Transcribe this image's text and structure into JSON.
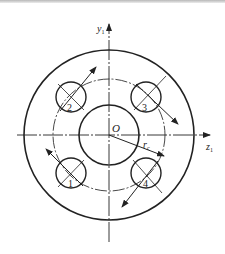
{
  "diagram": {
    "title": "",
    "axes": {
      "vertical_label": "y",
      "vertical_subscript": "1",
      "horizontal_label": "z",
      "horizontal_subscript": "1"
    },
    "origin_label": "O",
    "radius_label": "r",
    "radius_subscript": "c",
    "holes": [
      {
        "id": "1",
        "label": "1",
        "position": "lower-left",
        "arrow": "up-left"
      },
      {
        "id": "2",
        "label": "2",
        "position": "upper-left",
        "arrow": "up-right"
      },
      {
        "id": "3",
        "label": "3",
        "position": "upper-right",
        "arrow": "down-right"
      },
      {
        "id": "4",
        "label": "4",
        "position": "lower-right",
        "arrow": "down-left"
      }
    ],
    "colors": {
      "line": "#222222",
      "background": "#ffffff"
    }
  }
}
